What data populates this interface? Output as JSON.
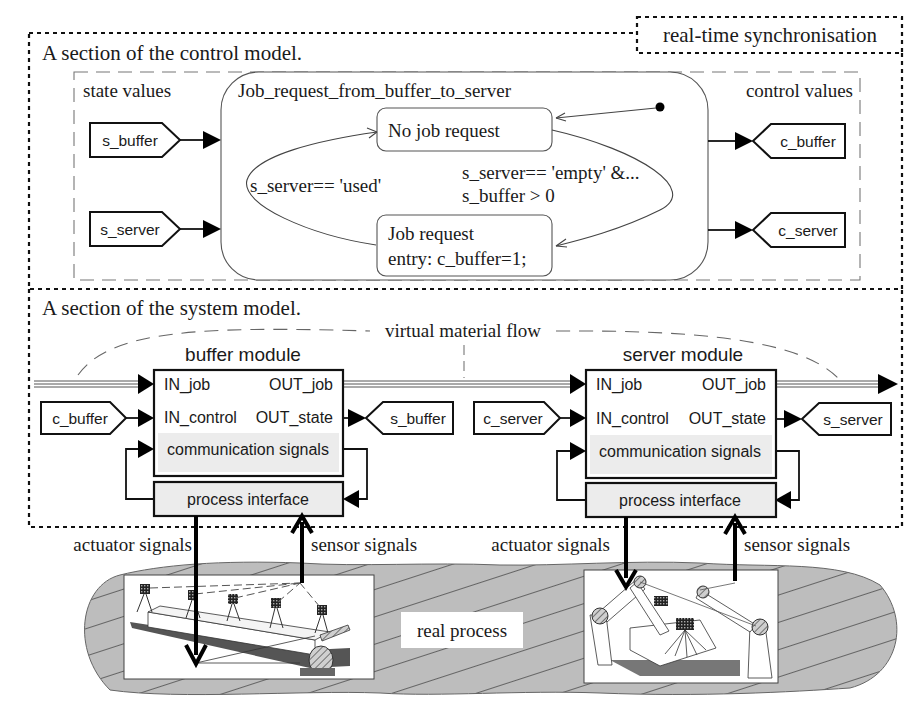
{
  "sync_label": "real-time synchronisation",
  "control_model": {
    "title": "A section of the control model.",
    "state_values_label": "state values",
    "control_values_label": "control values",
    "inputs": [
      "s_buffer",
      "s_server"
    ],
    "outputs": [
      "c_buffer",
      "c_server"
    ],
    "statechart": {
      "name": "Job_request_from_buffer_to_server",
      "states": [
        {
          "label": "No job request"
        },
        {
          "label": "Job request",
          "entry": "entry: c_buffer=1;"
        }
      ],
      "transitions": [
        {
          "from": "No job request",
          "to": "Job request",
          "guard_line1": "s_server== 'empty'  &...",
          "guard_line2": "s_buffer > 0"
        },
        {
          "from": "Job request",
          "to": "No job request",
          "guard": "s_server== 'used'"
        }
      ]
    }
  },
  "system_model": {
    "title": "A section of the system model.",
    "flow_label": "virtual material flow",
    "modules": [
      {
        "name": "buffer module",
        "in_job": "IN_job",
        "out_job": "OUT_job",
        "in_control": "IN_control",
        "out_state": "OUT_state",
        "comm": "communication signals",
        "interface": "process interface",
        "control_input": "c_buffer",
        "state_output": "s_buffer"
      },
      {
        "name": "server module",
        "in_job": "IN_job",
        "out_job": "OUT_job",
        "in_control": "IN_control",
        "out_state": "OUT_state",
        "comm": "communication signals",
        "interface": "process interface",
        "control_input": "c_server",
        "state_output": "s_server"
      }
    ]
  },
  "real_process": {
    "label": "real process",
    "signals": [
      {
        "actuator": "actuator signals",
        "sensor": "sensor signals"
      },
      {
        "actuator": "actuator signals",
        "sensor": "sensor signals"
      }
    ],
    "illustrations": [
      "conveyor-belt-with-sensors",
      "robot-arms-with-camera"
    ]
  }
}
